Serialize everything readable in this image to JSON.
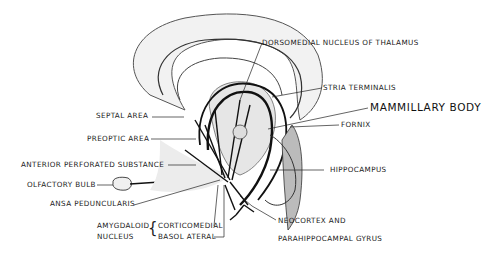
{
  "diagram": {
    "colors": {
      "ink": "#111111",
      "stipple": "#8a8a8a",
      "background": "#ffffff"
    },
    "labels": [
      {
        "id": "dorsomedial",
        "text": "DORSOMEDIAL  NUCLEUS  OF  THALAMUS",
        "x": 262,
        "y": 39,
        "big": false,
        "leader": [
          [
            262,
            43
          ],
          [
            240,
            100
          ]
        ]
      },
      {
        "id": "stria",
        "text": "STRIA TERMINALIS",
        "x": 323,
        "y": 84,
        "big": false,
        "leader": [
          [
            322,
            88
          ],
          [
            272,
            97
          ]
        ]
      },
      {
        "id": "mammillary",
        "text": "MAMMILLARY  BODY",
        "x": 370,
        "y": 102,
        "big": true,
        "leader": [
          [
            368,
            108
          ],
          [
            268,
            129
          ]
        ]
      },
      {
        "id": "fornix",
        "text": "FORNIX",
        "x": 341,
        "y": 121,
        "big": false,
        "leader": [
          [
            339,
            125
          ],
          [
            290,
            127
          ]
        ]
      },
      {
        "id": "septal",
        "text": "SEPTAL AREA",
        "x": 96,
        "y": 112,
        "big": false,
        "leader": [
          [
            152,
            117
          ],
          [
            184,
            117
          ]
        ]
      },
      {
        "id": "preoptic",
        "text": "PREOPTIC  AREA",
        "x": 87,
        "y": 135,
        "big": false,
        "leader": [
          [
            151,
            139
          ],
          [
            196,
            139
          ]
        ]
      },
      {
        "id": "aps",
        "text": "ANTERIOR  PERFORATED  SUBSTANCE",
        "x": 21,
        "y": 161,
        "big": false,
        "leader": [
          [
            168,
            165
          ],
          [
            196,
            165
          ]
        ]
      },
      {
        "id": "olfactory",
        "text": "OLFACTORY  BULB",
        "x": 27,
        "y": 181,
        "big": false,
        "leader": [
          [
            97,
            185
          ],
          [
            113,
            185
          ]
        ]
      },
      {
        "id": "ansa",
        "text": "ANSA  PEDUNCULARIS",
        "x": 50,
        "y": 200,
        "big": false,
        "leader": [
          [
            134,
            205
          ],
          [
            220,
            180
          ]
        ]
      },
      {
        "id": "amygdaloid1",
        "text": "AMYGDALOID",
        "x": 97,
        "y": 222,
        "big": false,
        "leader": null
      },
      {
        "id": "amygdaloid2",
        "text": "NUCLEUS",
        "x": 97,
        "y": 233,
        "big": false,
        "leader": null
      },
      {
        "id": "corticomedial",
        "text": "CORTICOMEDIAL",
        "x": 158,
        "y": 222,
        "big": false,
        "leader": [
          [
            214,
            226
          ],
          [
            218,
            185
          ]
        ]
      },
      {
        "id": "basolateral",
        "text": "BASOL ATERAL",
        "x": 158,
        "y": 233,
        "big": false,
        "leader": [
          [
            214,
            237
          ],
          [
            224,
            237
          ],
          [
            224,
            185
          ]
        ]
      },
      {
        "id": "hippocampus",
        "text": "HIPPOCAMPUS",
        "x": 330,
        "y": 166,
        "big": false,
        "leader": [
          [
            324,
            170
          ],
          [
            270,
            170
          ]
        ]
      },
      {
        "id": "neocortex1",
        "text": "NEOCORTEX    AND",
        "x": 278,
        "y": 217,
        "big": false,
        "leader": [
          [
            276,
            220
          ],
          [
            252,
            206
          ],
          [
            240,
            196
          ]
        ]
      },
      {
        "id": "neocortex2",
        "text": "PARAHIPPOCAMPAL  GYRUS",
        "x": 278,
        "y": 235,
        "big": false,
        "leader": null
      }
    ],
    "brace": {
      "text": "{",
      "x": 148,
      "y": 221
    }
  }
}
